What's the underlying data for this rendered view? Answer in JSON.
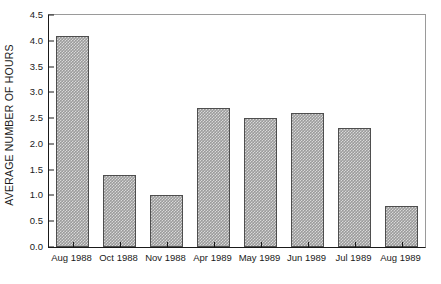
{
  "chart_data": {
    "type": "bar",
    "title": "",
    "subtitle": "",
    "xlabel": "",
    "ylabel": "AVERAGE NUMBER OF HOURS",
    "categories": [
      "Aug 1988",
      "Oct 1988",
      "Nov 1988",
      "Apr 1989",
      "May 1989",
      "Jun 1989",
      "Jul 1989",
      "Aug 1989"
    ],
    "values": [
      4.1,
      1.4,
      1.0,
      2.7,
      2.5,
      2.6,
      2.3,
      0.8
    ],
    "ylim": [
      0.0,
      4.5
    ],
    "xlim_note": "categorical",
    "ytick_labels": [
      "0.0",
      "0.5",
      "1.0",
      "1.5",
      "2.0",
      "2.5",
      "3.0",
      "3.5",
      "4.0",
      "4.5"
    ],
    "ytick_values": [
      0.0,
      0.5,
      1.0,
      1.5,
      2.0,
      2.5,
      3.0,
      3.5,
      4.0,
      4.5
    ],
    "grid": false,
    "legend": null,
    "legend_position": "none",
    "annotations": [],
    "bar_fill_color": "#9b9b9b",
    "bar_edge_color": "#4e4e4e",
    "bar_pattern": "checkered-halftone",
    "axis_color": "#1a1a1a",
    "frame_color": "#9a9a9a",
    "background_color": "#ffffff"
  }
}
